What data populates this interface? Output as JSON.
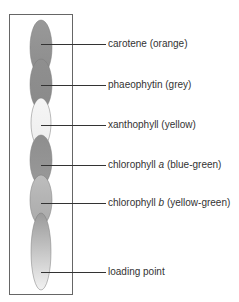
{
  "diagram": {
    "frame": {
      "x": 9,
      "y": 14,
      "width": 63,
      "height": 280,
      "stroke": "#666666"
    },
    "spots": [
      {
        "name": "carotene",
        "cx": 41,
        "top": 20,
        "bottom": 75,
        "rx": 11,
        "fill_top": "#999999",
        "fill_bottom": "#8c8c8c"
      },
      {
        "name": "phaeophytin",
        "cx": 41,
        "top": 59,
        "bottom": 110,
        "rx": 11,
        "fill_top": "#8f8f8f",
        "fill_bottom": "#8a8a8a"
      },
      {
        "name": "xanthophyll",
        "cx": 41,
        "top": 98,
        "bottom": 148,
        "rx": 10,
        "fill_top": "#f5f5f5",
        "fill_bottom": "#eeeeee"
      },
      {
        "name": "chlorophyll-a",
        "cx": 41,
        "top": 135,
        "bottom": 185,
        "rx": 11,
        "fill_top": "#8e8e8e",
        "fill_bottom": "#999999"
      },
      {
        "name": "chlorophyll-b",
        "cx": 41,
        "top": 175,
        "bottom": 225,
        "rx": 11,
        "fill_top": "#bdbdbd",
        "fill_bottom": "#aaaaaa"
      },
      {
        "name": "loading-streak",
        "cx": 41,
        "top": 213,
        "bottom": 290,
        "rx": 10,
        "fill_top": "#9a9a9a",
        "fill_bottom": "#f2f2f2"
      }
    ],
    "labels": [
      {
        "id": "carotene",
        "pre": "carotene (orange)",
        "italic": "",
        "post": "",
        "y": 44
      },
      {
        "id": "phaeophytin",
        "pre": "phaeophytin (grey)",
        "italic": "",
        "post": "",
        "y": 85
      },
      {
        "id": "xanthophyll",
        "pre": "xanthophyll (yellow)",
        "italic": "",
        "post": "",
        "y": 125
      },
      {
        "id": "chlorophyll-a",
        "pre": "chlorophyll ",
        "italic": "a",
        "post": " (blue-green)",
        "y": 165
      },
      {
        "id": "chlorophyll-b",
        "pre": "chlorophyll ",
        "italic": "b",
        "post": " (yellow-green)",
        "y": 203
      },
      {
        "id": "loading-point",
        "pre": "loading point",
        "italic": "",
        "post": "",
        "y": 272
      }
    ],
    "leader_start_x": 41,
    "leader_end_x": 106,
    "label_x": 108
  }
}
